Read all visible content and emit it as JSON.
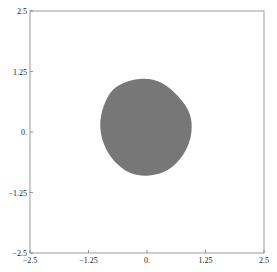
{
  "chart_data": {
    "type": "area",
    "title": "",
    "xlabel": "",
    "ylabel": "",
    "xlim": [
      -2.5,
      2.5
    ],
    "ylim": [
      -2.5,
      2.5
    ],
    "grid": false,
    "legend": null,
    "x_ticks": [
      -2.5,
      -1.25,
      0,
      1.25,
      2.5
    ],
    "x_tick_labels": [
      "-2.5",
      "-1.25",
      "0.",
      "1.25",
      "2.5"
    ],
    "y_ticks": [
      -2.5,
      -1.25,
      0,
      1.25,
      2.5
    ],
    "y_tick_labels": [
      "-2.5",
      "-1.25",
      "0.",
      "1.25",
      "2.5"
    ],
    "fill_color": "#777777",
    "frame_color": "#999999",
    "region": {
      "description": "filled roughly circular region",
      "center": [
        -0.05,
        0.25
      ],
      "x_extent": [
        -1.0,
        0.95
      ],
      "y_extent": [
        -0.9,
        1.1
      ],
      "boundary": [
        [
          -0.05,
          1.1
        ],
        [
          0.3,
          1.02
        ],
        [
          0.6,
          0.8
        ],
        [
          0.85,
          0.5
        ],
        [
          0.95,
          0.2
        ],
        [
          0.92,
          -0.15
        ],
        [
          0.75,
          -0.5
        ],
        [
          0.45,
          -0.78
        ],
        [
          0.05,
          -0.9
        ],
        [
          -0.35,
          -0.85
        ],
        [
          -0.7,
          -0.6
        ],
        [
          -0.92,
          -0.25
        ],
        [
          -1.0,
          0.15
        ],
        [
          -0.92,
          0.55
        ],
        [
          -0.72,
          0.88
        ],
        [
          -0.4,
          1.05
        ]
      ]
    }
  }
}
